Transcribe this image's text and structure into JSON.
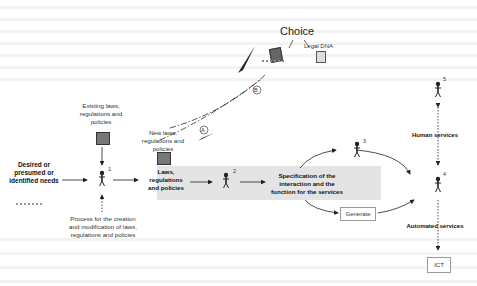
{
  "diagram": {
    "title": "Choice",
    "legal_dna_label": "Legal DNA",
    "needs_label": "Desired or presumed or identified needs",
    "existing_laws_label": "Existing laws, regulations and policies",
    "new_laws_label": "New laws, regulations and policies",
    "laws_label": "Laws, regulations and policies",
    "process_label": "Process for the creation and modification of laws, regulations and policies",
    "specification_label": "Specification of the interaction and the function for the services",
    "generate_label": "Generate",
    "human_services_label": "Human services",
    "automated_services_label": "Automated services",
    "ict_label": "ICT",
    "path_a_label": "A",
    "path_b_label": "B",
    "actors": [
      {
        "number": "1"
      },
      {
        "number": "2"
      },
      {
        "number": "3"
      },
      {
        "number": "4"
      },
      {
        "number": "5"
      }
    ],
    "colors": {
      "band": "#e4e4e4",
      "line": "#222222",
      "background_text": "#f3f3f3"
    }
  }
}
